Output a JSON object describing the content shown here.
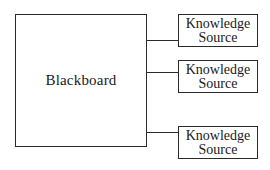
{
  "diagram": {
    "blackboard": {
      "label": "Blackboard"
    },
    "knowledge_sources": [
      {
        "line1": "Knowledge",
        "line2": "Source",
        "top": 14,
        "connector_y": 41
      },
      {
        "line1": "Knowledge",
        "line2": "Source",
        "top": 60,
        "connector_y": 73
      },
      {
        "line1": "Knowledge",
        "line2": "Source",
        "top": 126,
        "connector_y": 133
      }
    ],
    "colors": {
      "stroke": "#2a2a2a",
      "background": "#ffffff",
      "text": "#1a1a1a"
    }
  }
}
